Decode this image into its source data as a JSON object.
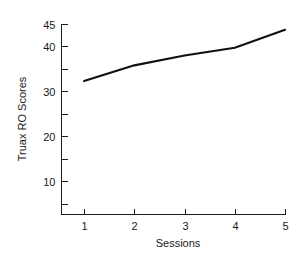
{
  "chart_data": {
    "type": "line",
    "title": "",
    "xlabel": "Sessions",
    "ylabel": "Truax RO Scores",
    "categories": [
      1,
      2,
      3,
      4,
      5
    ],
    "x": [
      1,
      2,
      3,
      4,
      5
    ],
    "values": [
      32.3,
      35.8,
      38.0,
      39.7,
      43.7
    ],
    "series": [
      {
        "name": "Truax RO Scores",
        "values": [
          32.3,
          35.8,
          38.0,
          39.7,
          43.7
        ]
      }
    ],
    "xlim": [
      0.55,
      5.0
    ],
    "ylim": [
      2.5,
      45.0
    ],
    "grid": false,
    "legend": "none",
    "line_color": "#111111",
    "background_color": "#ffffff",
    "x_tick_labels": [
      "1",
      "2",
      "3",
      "4",
      "5"
    ],
    "y_tick_labels_major": [
      "10",
      "20",
      "30",
      "40",
      "45"
    ],
    "y_ticks_major": [
      10,
      20,
      30,
      40,
      45
    ],
    "y_ticks_minor": [
      5,
      15,
      25,
      35
    ],
    "x_ticks": [
      1,
      2,
      3,
      4,
      5
    ]
  },
  "axes": {
    "y_axis_title": "Truax RO Scores",
    "x_axis_title": "Sessions"
  }
}
